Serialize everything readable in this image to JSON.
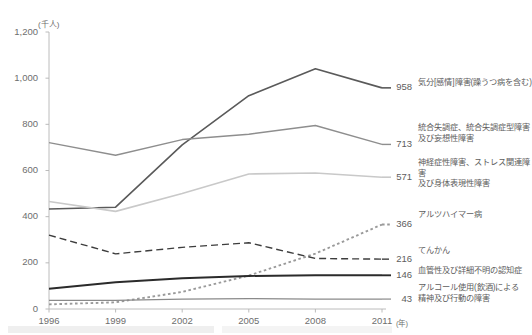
{
  "chart_data": {
    "type": "line",
    "title": "",
    "subtitle": "",
    "xlabel": "年",
    "ylabel": "千人",
    "unit_note": "(千人)",
    "x": [
      1996,
      1999,
      2002,
      2005,
      2008,
      2011
    ],
    "xtick_labels": [
      "1996",
      "1999",
      "2002",
      "2005",
      "2008",
      "2011"
    ],
    "x_unit_suffix": "(年)",
    "ylim": [
      0,
      1200
    ],
    "ytick_labels": [
      "0",
      "200",
      "400",
      "600",
      "800",
      "1,000",
      "1,200"
    ],
    "ytick_values": [
      0,
      200,
      400,
      600,
      800,
      1000,
      1200
    ],
    "grid": false,
    "legend_position": "right-inline",
    "series": [
      {
        "name": "気分[感情]障害(躁うつ病を含む)",
        "end_value": "958",
        "values": [
          433,
          441,
          711,
          924,
          1041,
          958
        ],
        "style": "solid",
        "color": "#5a5a5a",
        "width": 1.6
      },
      {
        "name": "統合失調症、統合失調症型障害\n及び妄想性障害",
        "end_value": "713",
        "values": [
          721,
          666,
          734,
          757,
          795,
          713
        ],
        "style": "solid",
        "color": "#8e8e8e",
        "width": 1.4
      },
      {
        "name": "神経症性障害、ストレス関連障害\n及び身体表現性障害",
        "end_value": "571",
        "values": [
          466,
          423,
          500,
          585,
          589,
          571
        ],
        "style": "solid",
        "color": "#c9c9c9",
        "width": 1.6
      },
      {
        "name": "アルツハイマー病",
        "end_value": "366",
        "values": [
          20,
          29,
          74,
          145,
          240,
          366
        ],
        "style": "dotted",
        "color": "#9a9a9a",
        "width": 1.9
      },
      {
        "name": "てんかん",
        "end_value": "216",
        "values": [
          320,
          239,
          267,
          287,
          219,
          216
        ],
        "style": "dashed",
        "color": "#3d3d3d",
        "width": 1.4
      },
      {
        "name": "血管性及び詳細不明の認知症",
        "end_value": "146",
        "values": [
          88,
          116,
          133,
          143,
          146,
          146
        ],
        "style": "solid",
        "color": "#2b2b2b",
        "width": 1.9
      },
      {
        "name": "アルコール使用(飲酒)による\n精神及び行動の障害",
        "end_value": "43",
        "values": [
          37,
          37,
          43,
          45,
          43,
          43
        ],
        "style": "solid",
        "color": "#8a8a8a",
        "width": 1.2
      }
    ],
    "colors": {
      "axis": "#b4b4b4",
      "text": "#6e6e6e",
      "background": "#ffffff"
    }
  }
}
